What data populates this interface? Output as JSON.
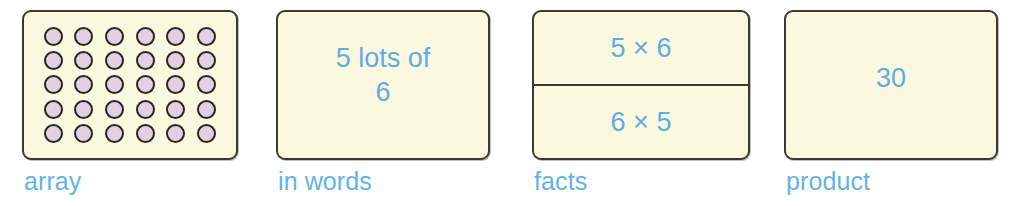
{
  "background_color": "#ffffff",
  "accent_text_color": "#5eade4",
  "card_fill_color": "#fbf8e0",
  "card_border_color": "#3a3a32",
  "dot_fill_color": "#e3cfe2",
  "dot_border_color": "#262622",
  "panels": [
    {
      "id": "array",
      "caption": "array",
      "content_type": "dot-array",
      "rows": 5,
      "columns": 6,
      "total_dots": 30
    },
    {
      "id": "in-words",
      "caption": "in words",
      "content_type": "text",
      "text": "5 lots of\n6"
    },
    {
      "id": "facts",
      "caption": "facts",
      "content_type": "two-cells",
      "cells": [
        "5 × 6",
        "6 × 5"
      ]
    },
    {
      "id": "product",
      "caption": "product",
      "content_type": "text",
      "text": "30"
    }
  ]
}
